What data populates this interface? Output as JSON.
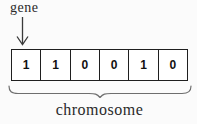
{
  "diagram": {
    "gene_label": "gene",
    "chromosome_label": "chromosome",
    "cells": [
      "1",
      "1",
      "0",
      "0",
      "1",
      "0"
    ]
  },
  "colors": {
    "background": "#fbfbfb",
    "cell_border": "#1f1f1f",
    "digit_text": "#111111",
    "label_text": "#2a2a2a",
    "brace_stroke": "#6e6e6e",
    "arrow_stroke": "#3a3a3a"
  }
}
